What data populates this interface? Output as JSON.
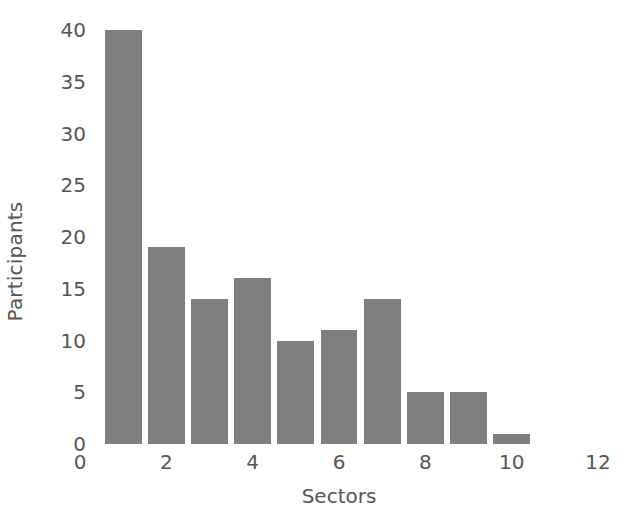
{
  "chart_data": {
    "type": "bar",
    "title": "",
    "xlabel": "Sectors",
    "ylabel": "Participants",
    "categories": [
      1,
      2,
      3,
      4,
      5,
      6,
      7,
      8,
      9,
      10
    ],
    "values": [
      40,
      19,
      14,
      16,
      10,
      11,
      14,
      5,
      5,
      1
    ],
    "xlim": [
      0,
      12
    ],
    "ylim": [
      0,
      40
    ],
    "xticks": [
      "0",
      "2",
      "4",
      "6",
      "8",
      "10",
      "12"
    ],
    "xtick_values": [
      0,
      2,
      4,
      6,
      8,
      10,
      12
    ],
    "yticks": [
      "0",
      "5",
      "10",
      "15",
      "20",
      "25",
      "30",
      "35",
      "40"
    ],
    "ytick_values": [
      0,
      5,
      10,
      15,
      20,
      25,
      30,
      35,
      40
    ],
    "grid": false,
    "legend": null,
    "bar_color": "#7f7f7f",
    "bar_width": 0.85,
    "axis_text_color": "#555555",
    "background_color": "#ffffff"
  }
}
